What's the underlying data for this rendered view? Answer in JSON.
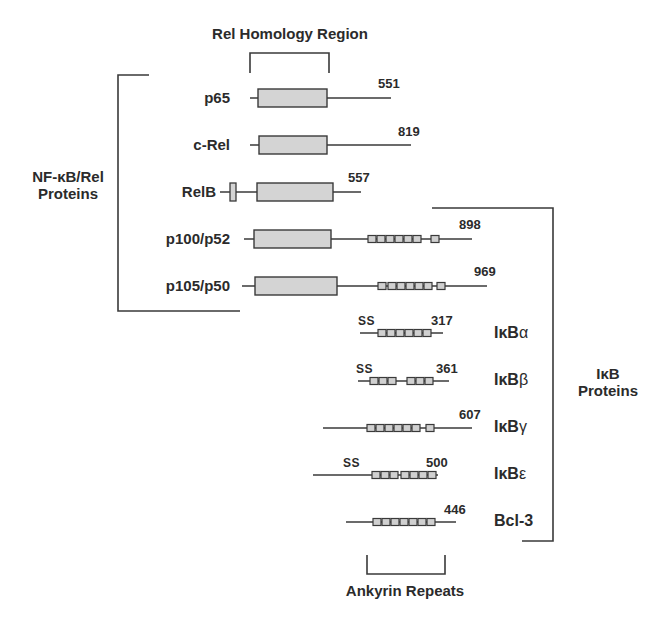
{
  "diagram": {
    "title_top": "Rel Homology Region",
    "title_bottom": "Ankyrin Repeats",
    "group_left": {
      "line1": "NF-κB/Rel",
      "line2": "Proteins"
    },
    "group_right": {
      "line1": "IκB",
      "line2": "Proteins"
    },
    "ss_label": "SS",
    "colors": {
      "stroke": "#3a3a3a",
      "box_fill": "#d4d4d4",
      "repeat_fill": "#d0d0d0"
    },
    "nfkb_proteins": [
      {
        "name": "p65",
        "length": "551"
      },
      {
        "name": "c-Rel",
        "length": "819"
      },
      {
        "name": "RelB",
        "length": "557"
      },
      {
        "name": "p100/p52",
        "length": "898"
      },
      {
        "name": "p105/p50",
        "length": "969"
      }
    ],
    "ikb_proteins": [
      {
        "prefix": "IκB",
        "suffix": "α",
        "length": "317",
        "ss": true
      },
      {
        "prefix": "IκB",
        "suffix": "β",
        "length": "361",
        "ss": true
      },
      {
        "prefix": "IκB",
        "suffix": "γ",
        "length": "607",
        "ss": false
      },
      {
        "prefix": "IκB",
        "suffix": "ε",
        "length": "500",
        "ss": true
      },
      {
        "name": "Bcl-3",
        "length": "446",
        "ss": false
      }
    ]
  }
}
